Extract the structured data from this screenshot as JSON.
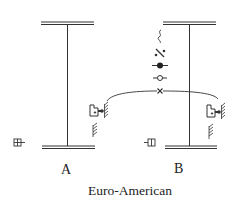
{
  "diagram": {
    "type": "comparative symbol diagram",
    "caption": "Euro-American",
    "labels": {
      "a": "A",
      "b": "B"
    },
    "colors": {
      "stroke": "#333333",
      "background": "#ffffff",
      "hatch": "#444444"
    },
    "panels": [
      {
        "id": "A",
        "elements": [
          "top double line",
          "vertical stem",
          "bottom double line",
          "box-with-pin symbol",
          "hatched stop symbols",
          "boxed cross symbol"
        ]
      },
      {
        "id": "B",
        "elements": [
          "top double line",
          "vertical stem",
          "bottom double line",
          "wave symbol",
          "slashed-dots symbol",
          "filled-dot symbol",
          "open-circle symbol",
          "cross-mark symbol",
          "box-with-pin symbol",
          "hatched stop symbols",
          "boxed symbol"
        ]
      }
    ],
    "connector": "curved arc joining A and B through cross mark"
  }
}
